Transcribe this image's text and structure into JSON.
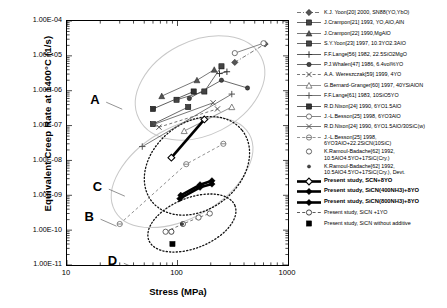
{
  "chart_data": {
    "type": "scatter",
    "title": "",
    "xlabel": "Stress (MPa)",
    "ylabel": "Equivalent Creep Rate at 1400°C (1/s)",
    "xscale": "log",
    "yscale": "log",
    "xlim": [
      10,
      1000
    ],
    "ylim": [
      1e-11,
      0.0001
    ],
    "grid": false,
    "legend_position": "right",
    "xticks": [
      "10",
      "100",
      "1000"
    ],
    "yticks": [
      "1.00E-04",
      "1.00E-05",
      "1.00E-06",
      "1.00E-07",
      "1.00E-08",
      "1.00E-09",
      "1.00E-10",
      "1.00E-11"
    ],
    "annotations": [
      {
        "label": "A",
        "x": 18,
        "y": 5e-07
      },
      {
        "label": "B",
        "x": 16,
        "y": 2.2e-10
      },
      {
        "label": "C",
        "x": 19,
        "y": 1.6e-09
      },
      {
        "label": "D",
        "x": 26,
        "y": 1.2e-11
      }
    ],
    "series": [
      {
        "name": "K.J. Yoon[20] 2000, SN88(YO,YbO)",
        "marker": "diamond-filled",
        "line": "dash-dot",
        "color": "#555555",
        "points": [
          [
            330,
            6.5e-06
          ],
          [
            620,
            2.2e-05
          ]
        ]
      },
      {
        "name": "J.Crampon[21] 1993, YO,AlO,AlN",
        "marker": "square-filled",
        "line": "solid",
        "color": "#444444",
        "points": [
          [
            60,
            1.1e-07
          ],
          [
            125,
            3.4e-07
          ]
        ]
      },
      {
        "name": "J.Crampon[22] 1990,MgAlO",
        "marker": "triangle-filled",
        "line": "solid",
        "color": "#555555",
        "points": [
          [
            72,
            7e-07
          ],
          [
            150,
            2e-06
          ],
          [
            215,
            4e-06
          ]
        ]
      },
      {
        "name": "S.Y.Yoon[23] 1997, 10.3YO2.3AlO",
        "marker": "square-filled",
        "line": "solid",
        "color": "#444444",
        "points": [
          [
            98,
            5.5e-07
          ],
          [
            175,
            9.5e-07
          ],
          [
            250,
            5e-06
          ]
        ]
      },
      {
        "name": "F.F.Lange[56] 1982, 22.5SiO2MgO",
        "marker": "plus",
        "line": "solid",
        "color": "#333333",
        "points": [
          [
            240,
            3.1e-06
          ],
          [
            280,
            3.5e-06
          ]
        ]
      },
      {
        "name": "P.J.Whalen[47] 1986, 6.4vol%YO",
        "marker": "circle-filled",
        "line": "solid",
        "color": "#444444",
        "points": [
          [
            128,
            6e-07
          ],
          [
            250,
            2e-06
          ],
          [
            430,
            1.2e-06
          ]
        ]
      },
      {
        "name": "A.A. Wereszczak[59] 1999, 4YO",
        "marker": "x",
        "line": "dash",
        "color": "#555555",
        "points": [
          [
            68,
            9e-08
          ],
          [
            230,
            3e-07
          ]
        ]
      },
      {
        "name": "G.Bernard-Granger[60] 1997, 40YSiAlON",
        "marker": "triangle-open",
        "line": "solid",
        "color": "#777777",
        "points": [
          [
            115,
            7e-08
          ],
          [
            310,
            3.4e-07
          ]
        ]
      },
      {
        "name": "F.F.Lange[61] 1983, 10SiO5YO",
        "marker": "plus",
        "line": "solid",
        "color": "#555555",
        "points": [
          [
            48,
            2.5e-08
          ],
          [
            310,
            8e-07
          ]
        ]
      },
      {
        "name": "R.D.Nixon[24] 1990, 6YO1.5AlO",
        "marker": "square-filled",
        "line": "solid",
        "color": "#333333",
        "points": [
          [
            60,
            3e-07
          ],
          [
            140,
            9.5e-07
          ]
        ]
      },
      {
        "name": "J.-L.Besson[25] 1998, 6YO3AlO",
        "marker": "circle-open",
        "line": "solid",
        "color": "#666666",
        "points": [
          [
            330,
            1.2e-05
          ],
          [
            600,
            2.3e-05
          ]
        ]
      },
      {
        "name": "R.D.Nixon[24] 1990, 6YO1.5AlO/30SiC(w)",
        "marker": "x",
        "line": "solid",
        "color": "#555555",
        "points": [
          [
            62,
            1.1e-07
          ],
          [
            210,
            4.5e-07
          ]
        ]
      },
      {
        "name": "J.-L.Besson[25] 1998,\n6YO3AlO+22.2SiCN(10SiC)",
        "marker": "circle-half",
        "line": "dash",
        "color": "#777777",
        "points": [
          [
            30,
            1.5e-10
          ],
          [
            120,
            7.8e-09
          ],
          [
            260,
            3e-08
          ]
        ]
      },
      {
        "name": "K.Ramoul-Badache[62] 1992,\n10.5AlO4.5YO+17SiC(Cry.)",
        "marker": "circle-open",
        "line": "dash",
        "color": "#555555",
        "points": [
          [
            78,
            9e-11
          ],
          [
            112,
            1.5e-10
          ],
          [
            155,
            2.3e-10
          ],
          [
            196,
            3e-10
          ]
        ]
      },
      {
        "name": "K.Ramoul-Badache[62] 1992,\n10.5AlO4.5YO+17SiC(Cry.), Devt.",
        "marker": "circle-filled-sm",
        "line": "none",
        "color": "#444444",
        "points": [
          [
            110,
            1.5e-10
          ]
        ]
      },
      {
        "name": "Present study, SCN+8YO",
        "marker": "diamond-open",
        "line": "thick-solid",
        "color": "#000000",
        "points": [
          [
            88,
            1.2e-08
          ],
          [
            175,
            1.5e-07
          ]
        ]
      },
      {
        "name": "Present study, SiCN(400NH3)+8YO",
        "marker": "diamond-filled",
        "line": "thick-solid",
        "color": "#000000",
        "points": [
          [
            107,
            1e-09
          ],
          [
            160,
            2e-09
          ],
          [
            205,
            2.6e-09
          ]
        ]
      },
      {
        "name": "Present study, SiCN(800NH3)+8YO",
        "marker": "diamond-filled",
        "line": "thick-solid",
        "color": "#000000",
        "points": [
          [
            105,
            8e-10
          ],
          [
            160,
            1.7e-09
          ],
          [
            205,
            2.1e-09
          ]
        ]
      },
      {
        "name": "Present study, SiCN +1YO",
        "marker": "circle-open",
        "line": "dash",
        "color": "#333333",
        "points": [
          [
            88,
            9e-11
          ]
        ]
      },
      {
        "name": "Present study, SiCN without additive",
        "marker": "square-filled",
        "line": "none",
        "color": "#000000",
        "points": [
          [
            90,
            4e-11
          ]
        ]
      }
    ],
    "ellipses": [
      {
        "label": "A",
        "cx": 160,
        "cy": 1.2e-06,
        "rx_dec": 0.62,
        "ry_dec": 1.35,
        "rot": -27,
        "style": "light"
      },
      {
        "label": "B",
        "cx": 110,
        "cy": 4.5e-09,
        "rx_dec": 0.7,
        "ry_dec": 1.3,
        "rot": -30,
        "style": "light"
      },
      {
        "label": "C",
        "cx": 150,
        "cy": 7e-09,
        "rx_dec": 0.52,
        "ry_dec": 1.25,
        "rot": -38,
        "style": "dotted"
      },
      {
        "label": "D",
        "cx": 135,
        "cy": 1.6e-10,
        "rx_dec": 0.42,
        "ry_dec": 0.72,
        "rot": -22,
        "style": "dotted"
      }
    ]
  },
  "legend": {
    "entries": [
      {
        "label": "K.J. Yoon[20] 2000, SN88(YO,YbO)",
        "key": "dashdot-diamond"
      },
      {
        "label": "J.Crampon[21] 1993, YO,AlO,AlN",
        "key": "solid-square"
      },
      {
        "label": "J.Crampon[22] 1990,MgAlO",
        "key": "solid-triangle"
      },
      {
        "label": "S.Y.Yoon[23] 1997, 10.3YO2.3AlO",
        "key": "solid-square2"
      },
      {
        "label": "F.F.Lange[56] 1982, 22.5SiO2MgO",
        "key": "solid-plus"
      },
      {
        "label": "P.J.Whalen[47] 1986, 6.4vol%YO",
        "key": "solid-circle"
      },
      {
        "label": "A.A. Wereszczak[59] 1999, 4YO",
        "key": "dash-x"
      },
      {
        "label": "G.Bernard-Granger[60] 1997, 40YSiAlON",
        "key": "solid-triangle-open"
      },
      {
        "label": "F.F.Lange[61] 1983, 10SiO5YO",
        "key": "solid-plus2"
      },
      {
        "label": "R.D.Nixon[24] 1990, 6YO1.5AlO",
        "key": "solid-square3"
      },
      {
        "label": "J.-L.Besson[25] 1998, 6YO3AlO",
        "key": "solid-circle-open"
      },
      {
        "label": "R.D.Nixon[24] 1990, 6YO1.5AlO/30SiC(w)",
        "key": "solid-x"
      },
      {
        "label": "J.-L.Besson[25] 1998,\n6YO3AlO+22.2SiCN(10SiC)",
        "key": "dash-circle-half"
      },
      {
        "label": "K.Ramoul-Badache[62] 1992,\n10.5AlO4.5YO+17SiC(Cry.)",
        "key": "circle-open-only"
      },
      {
        "label": "K.Ramoul-Badache[62] 1992,\n10.5AlO4.5YO+17SiC(Cry.), Devt.",
        "key": "circle-filled-only"
      },
      {
        "label": "Present study, SCN+8YO",
        "key": "thick-diamond-open"
      },
      {
        "label": "Present study, SiCN(400NH3)+8YO",
        "key": "thick-diamond-filled"
      },
      {
        "label": "Present study, SiCN(800NH3)+8YO",
        "key": "thick-diamond-filled2"
      },
      {
        "label": "Present study, SiCN +1YO",
        "key": "dash-circle-open"
      },
      {
        "label": "Present study, SiCN without additive",
        "key": "square-filled-only"
      }
    ]
  }
}
